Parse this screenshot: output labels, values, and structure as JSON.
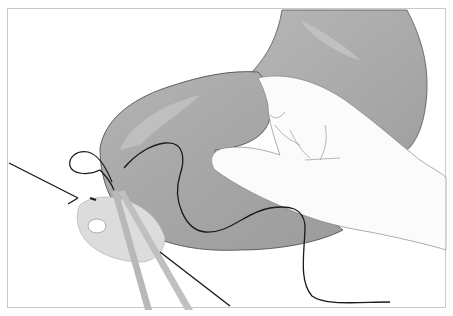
{
  "figure": {
    "type": "medical-illustration",
    "elements": [
      "stomach",
      "hand",
      "suture-thread",
      "needle-holder-instrument",
      "duodenum-stump"
    ],
    "colors": {
      "background": "#ffffff",
      "frame": "#c8c8c8",
      "stomach_fill": "#a9a9a9",
      "stomach_light": "#c2c2c2",
      "hand_fill": "#fbfbfb",
      "outline": "#3a3a3a",
      "thread": "#1a1a1a",
      "instrument": "#b8b8b8",
      "stump_fill": "#dcdcdc"
    }
  }
}
